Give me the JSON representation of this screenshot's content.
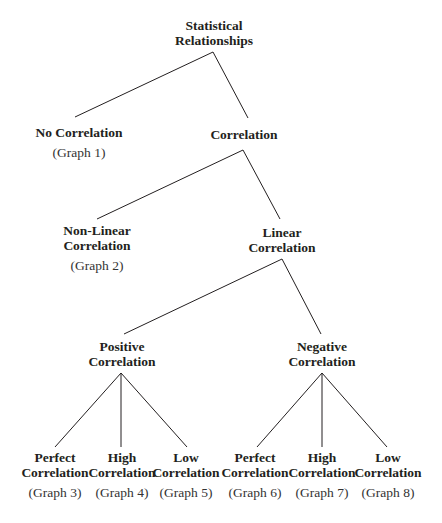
{
  "diagram": {
    "type": "tree",
    "root": "statistical_relationships",
    "colors": {
      "text": "#231f20",
      "lines": "#231f20",
      "background": "#ffffff"
    },
    "nodes": {
      "statistical_relationships": {
        "line1": "Statistical",
        "line2": "Relationships"
      },
      "no_correlation": {
        "line1": "No Correlation",
        "graph": "(Graph 1)"
      },
      "correlation": {
        "line1": "Correlation"
      },
      "non_linear": {
        "line1": "Non-Linear",
        "line2": "Correlation",
        "graph": "(Graph 2)"
      },
      "linear": {
        "line1": "Linear",
        "line2": "Correlation"
      },
      "positive": {
        "line1": "Positive",
        "line2": "Correlation"
      },
      "negative": {
        "line1": "Negative",
        "line2": "Correlation"
      },
      "pos_perfect": {
        "line1": "Perfect",
        "line2": "Correlation",
        "graph": "(Graph 3)"
      },
      "pos_high": {
        "line1": "High",
        "line2": "Correlation",
        "graph": "(Graph 4)"
      },
      "pos_low": {
        "line1": "Low",
        "line2": "Correlation",
        "graph": "(Graph 5)"
      },
      "neg_perfect": {
        "line1": "Perfect",
        "line2": "Correlation",
        "graph": "(Graph 6)"
      },
      "neg_high": {
        "line1": "High",
        "line2": "Correlation",
        "graph": "(Graph 7)"
      },
      "neg_low": {
        "line1": "Low",
        "line2": "Correlation",
        "graph": "(Graph 8)"
      }
    },
    "edges": [
      [
        "statistical_relationships",
        "no_correlation"
      ],
      [
        "statistical_relationships",
        "correlation"
      ],
      [
        "correlation",
        "non_linear"
      ],
      [
        "correlation",
        "linear"
      ],
      [
        "linear",
        "positive"
      ],
      [
        "linear",
        "negative"
      ],
      [
        "positive",
        "pos_perfect"
      ],
      [
        "positive",
        "pos_high"
      ],
      [
        "positive",
        "pos_low"
      ],
      [
        "negative",
        "neg_perfect"
      ],
      [
        "negative",
        "neg_high"
      ],
      [
        "negative",
        "neg_low"
      ]
    ]
  }
}
